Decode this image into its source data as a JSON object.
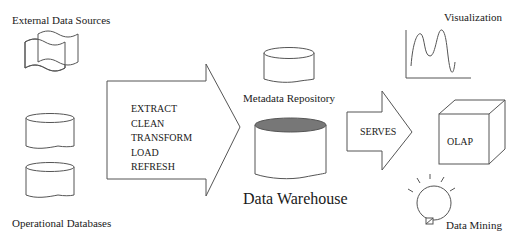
{
  "diagram": {
    "labels": {
      "external_sources": "External Data Sources",
      "operational_databases": "Operational Databases",
      "metadata_repository": "Metadata Repository",
      "data_warehouse": "Data Warehouse",
      "visualization": "Visualization",
      "olap": "OLAP",
      "data_mining": "Data Mining"
    },
    "etl_arrow": {
      "steps": [
        "EXTRACT",
        "CLEAN",
        "TRANSFORM",
        "LOAD",
        "REFRESH"
      ]
    },
    "serves_arrow": {
      "label": "SERVES"
    },
    "colors": {
      "stroke": "#555555",
      "warehouse_top": "#777777",
      "background": "#ffffff"
    }
  }
}
